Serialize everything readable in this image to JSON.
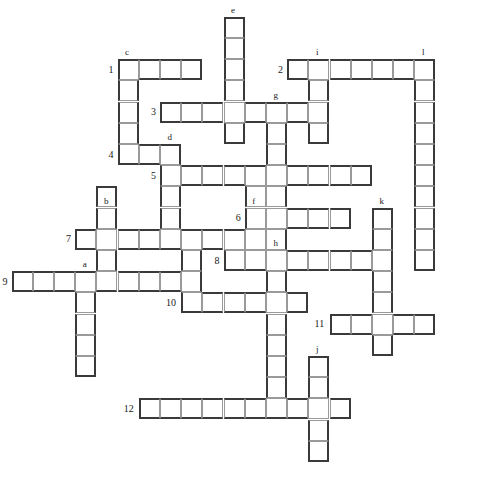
{
  "puzzle": {
    "type": "crossword-grid",
    "width": 492,
    "height": 503,
    "cell_size": 21.2,
    "origin_x": 11.5,
    "origin_y": 16.7,
    "background_color": "#ffffff",
    "cell_fill": "#ffffff",
    "cell_border_color": "#9a9a9a",
    "cell_border_accent": "#3a3a3a",
    "label_color": "#1a1a1a"
  },
  "across": [
    {
      "number": "1",
      "row": 3,
      "col": 6,
      "length": 4
    },
    {
      "number": "2",
      "row": 3,
      "col": 14,
      "length": 6
    },
    {
      "number": "3",
      "row": 5,
      "col": 8,
      "length": 8
    },
    {
      "number": "4",
      "row": 7,
      "col": 6,
      "length": 3
    },
    {
      "number": "5",
      "row": 8,
      "col": 8,
      "length": 10
    },
    {
      "number": "6",
      "row": 10,
      "col": 12,
      "length": 5
    },
    {
      "number": "7",
      "row": 11,
      "col": 4,
      "length": 8
    },
    {
      "number": "8",
      "row": 12,
      "col": 11,
      "length": 7
    },
    {
      "number": "9",
      "row": 13,
      "col": 1,
      "length": 9
    },
    {
      "number": "10",
      "row": 14,
      "col": 9,
      "length": 6
    },
    {
      "number": "11",
      "row": 15,
      "col": 16,
      "length": 5
    },
    {
      "number": "12",
      "row": 19,
      "col": 7,
      "length": 9
    }
  ],
  "down": [
    {
      "letter": "a",
      "row": 13,
      "col": 4,
      "length": 5
    },
    {
      "letter": "b",
      "row": 10,
      "col": 5,
      "length": 4
    },
    {
      "letter": "c",
      "row": 3,
      "col": 6,
      "length": 5
    },
    {
      "letter": "d",
      "row": 7,
      "col": 8,
      "length": 4
    },
    {
      "letter": "e",
      "row": 1,
      "col": 11,
      "length": 6
    },
    {
      "letter": "f",
      "row": 10,
      "col": 12,
      "length": 3
    },
    {
      "letter": "g",
      "row": 5,
      "col": 13,
      "length": 8
    },
    {
      "letter": "h",
      "row": 12,
      "col": 13,
      "length": 8
    },
    {
      "letter": "i",
      "row": 3,
      "col": 15,
      "length": 4
    },
    {
      "letter": "j",
      "row": 17,
      "col": 15,
      "length": 5
    },
    {
      "letter": "k",
      "row": 10,
      "col": 18,
      "length": 4
    },
    {
      "letter": "l",
      "row": 3,
      "col": 20,
      "length": 10
    }
  ],
  "cells": [
    [
      3,
      6
    ],
    [
      3,
      7
    ],
    [
      3,
      8
    ],
    [
      3,
      9
    ],
    [
      3,
      14
    ],
    [
      3,
      15
    ],
    [
      3,
      16
    ],
    [
      3,
      17
    ],
    [
      3,
      18
    ],
    [
      3,
      19
    ],
    [
      1,
      11
    ],
    [
      2,
      11
    ],
    [
      3,
      11
    ],
    [
      4,
      11
    ],
    [
      4,
      6
    ],
    [
      5,
      6
    ],
    [
      6,
      6
    ],
    [
      7,
      6
    ],
    [
      3,
      20
    ],
    [
      4,
      20
    ],
    [
      5,
      20
    ],
    [
      6,
      20
    ],
    [
      7,
      20
    ],
    [
      8,
      20
    ],
    [
      9,
      20
    ],
    [
      10,
      20
    ],
    [
      11,
      20
    ],
    [
      12,
      20
    ],
    [
      5,
      8
    ],
    [
      5,
      9
    ],
    [
      5,
      10
    ],
    [
      5,
      11
    ],
    [
      5,
      12
    ],
    [
      5,
      13
    ],
    [
      5,
      14
    ],
    [
      5,
      15
    ],
    [
      4,
      15
    ],
    [
      6,
      15
    ],
    [
      7,
      7
    ],
    [
      7,
      8
    ],
    [
      6,
      13
    ],
    [
      7,
      13
    ],
    [
      8,
      13
    ],
    [
      9,
      13
    ],
    [
      10,
      13
    ],
    [
      11,
      13
    ],
    [
      12,
      13
    ],
    [
      8,
      8
    ],
    [
      8,
      9
    ],
    [
      8,
      10
    ],
    [
      8,
      11
    ],
    [
      8,
      12
    ],
    [
      8,
      14
    ],
    [
      8,
      15
    ],
    [
      8,
      16
    ],
    [
      8,
      17
    ],
    [
      9,
      8
    ],
    [
      10,
      8
    ],
    [
      9,
      5
    ],
    [
      10,
      5
    ],
    [
      11,
      5
    ],
    [
      12,
      5
    ],
    [
      10,
      12
    ],
    [
      10,
      14
    ],
    [
      10,
      15
    ],
    [
      10,
      16
    ],
    [
      9,
      12
    ],
    [
      11,
      12
    ],
    [
      11,
      4
    ],
    [
      11,
      6
    ],
    [
      11,
      7
    ],
    [
      11,
      8
    ],
    [
      11,
      9
    ],
    [
      11,
      10
    ],
    [
      11,
      11
    ],
    [
      12,
      11
    ],
    [
      12,
      12
    ],
    [
      12,
      14
    ],
    [
      12,
      15
    ],
    [
      12,
      16
    ],
    [
      12,
      17
    ],
    [
      10,
      18
    ],
    [
      11,
      18
    ],
    [
      12,
      18
    ],
    [
      13,
      18
    ],
    [
      13,
      1
    ],
    [
      13,
      2
    ],
    [
      13,
      3
    ],
    [
      13,
      4
    ],
    [
      13,
      5
    ],
    [
      13,
      6
    ],
    [
      13,
      7
    ],
    [
      13,
      8
    ],
    [
      13,
      9
    ],
    [
      14,
      4
    ],
    [
      15,
      4
    ],
    [
      16,
      4
    ],
    [
      17,
      4
    ],
    [
      12,
      9
    ],
    [
      14,
      9
    ],
    [
      14,
      10
    ],
    [
      14,
      11
    ],
    [
      14,
      12
    ],
    [
      14,
      13
    ],
    [
      14,
      14
    ],
    [
      15,
      16
    ],
    [
      15,
      17
    ],
    [
      15,
      18
    ],
    [
      15,
      19
    ],
    [
      15,
      20
    ],
    [
      14,
      18
    ],
    [
      16,
      18
    ],
    [
      13,
      13
    ],
    [
      15,
      13
    ],
    [
      16,
      13
    ],
    [
      17,
      13
    ],
    [
      18,
      13
    ],
    [
      19,
      13
    ],
    [
      17,
      15
    ],
    [
      18,
      15
    ],
    [
      19,
      15
    ],
    [
      20,
      15
    ],
    [
      21,
      15
    ],
    [
      19,
      7
    ],
    [
      19,
      8
    ],
    [
      19,
      9
    ],
    [
      19,
      10
    ],
    [
      19,
      11
    ],
    [
      19,
      12
    ],
    [
      19,
      14
    ],
    [
      19,
      16
    ]
  ]
}
